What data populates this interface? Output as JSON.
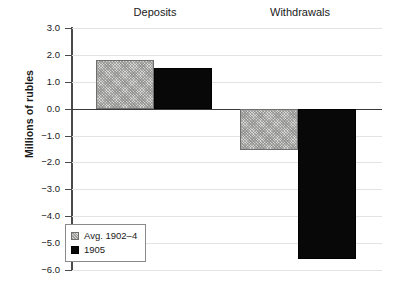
{
  "chart_data": {
    "type": "bar",
    "title": "",
    "subtitle": "",
    "xlabel": "",
    "ylabel": "Millions of rubles",
    "categories": [
      "Deposits",
      "Withdrawals"
    ],
    "series": [
      {
        "name": "Avg. 1902–4",
        "values": [
          1.8,
          -1.55
        ],
        "style": "hatched",
        "color": "#d6d6d2"
      },
      {
        "name": "1905",
        "values": [
          1.5,
          -5.6
        ],
        "style": "solid",
        "color": "#080808"
      }
    ],
    "ylim": [
      -6.0,
      3.0
    ],
    "ytick_labels": [
      "3.0",
      "2.0",
      "1.0",
      "0.0",
      "−1.0",
      "−2.0",
      "−3.0",
      "−4.0",
      "−5.0",
      "−6.0"
    ],
    "ytick_values": [
      3.0,
      2.0,
      1.0,
      0.0,
      -1.0,
      -2.0,
      -3.0,
      -4.0,
      -5.0,
      -6.0
    ],
    "grid": true,
    "zero_line": true,
    "legend_position": "bottom-left",
    "bars": [
      {
        "category": "Deposits",
        "series": "Avg. 1902–4",
        "value": 1.8,
        "style": "hatched"
      },
      {
        "category": "Deposits",
        "series": "1905",
        "value": 1.5,
        "style": "solid"
      },
      {
        "category": "Withdrawals",
        "series": "Avg. 1902–4",
        "value": -1.55,
        "style": "hatched"
      },
      {
        "category": "Withdrawals",
        "series": "1905",
        "value": -5.6,
        "style": "solid"
      }
    ]
  },
  "axis": {
    "y_title": "Millions of rubles"
  },
  "headers": {
    "deposits": "Deposits",
    "withdrawals": "Withdrawals"
  },
  "legend": {
    "items": [
      {
        "label": "Avg. 1902–4",
        "swatch": "hatched-swatch-icon"
      },
      {
        "label": "1905",
        "swatch": "solid-swatch-icon"
      }
    ]
  },
  "colors": {
    "hatched_fill": "#d6d6d2",
    "hatched_stroke": "#6f6f6f",
    "solid_fill": "#080808",
    "gridline": "#e3e3e1",
    "axis": "#4a4a4a",
    "text": "#1a1a1a",
    "background": "#ffffff"
  }
}
